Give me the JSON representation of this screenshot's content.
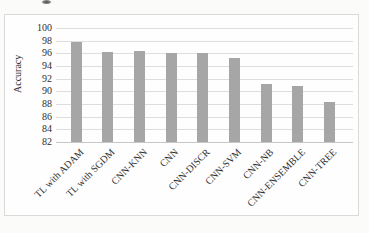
{
  "chart_data": {
    "type": "bar",
    "categories": [
      "TL with ADAM",
      "TL with SGDM",
      "CNN-KNN",
      "CNN",
      "CNN-DISCR",
      "CNN-SVM",
      "CNN-NB",
      "CNN-ENSEMBLE",
      "CNN-TREE"
    ],
    "values": [
      97.8,
      96.2,
      96.3,
      96.0,
      96.0,
      95.2,
      91.1,
      90.8,
      88.3
    ],
    "title": "",
    "xlabel": "",
    "ylabel": "Accuracy",
    "ylim": [
      82,
      100
    ],
    "ytick_step": 2,
    "yticks": [
      100,
      98,
      96,
      94,
      92,
      90,
      88,
      86,
      84,
      82
    ],
    "grid": true,
    "legend": false,
    "bar_color": "#a6a6a6",
    "gridline_color": "#dedede",
    "axis_line_color": "#c6c6c4",
    "text_color": "#2e2e2e",
    "frame_border_color": "#dadad8",
    "category_label_rotation_deg": 45
  }
}
